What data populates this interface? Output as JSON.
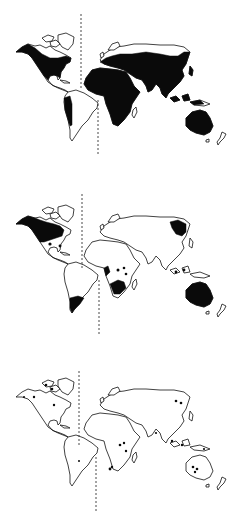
{
  "figure": {
    "colors": {
      "fill": "#0a0a0a",
      "outline": "#111111",
      "background": "#ffffff",
      "divider": "#333333"
    },
    "maps": [
      {
        "index": 1,
        "label": "",
        "shaded_regions": [
          "North America (south of arctic)",
          "Central America",
          "western South America",
          "Africa",
          "Eurasia (south of arctic)",
          "South/Southeast Asia",
          "Indonesia",
          "Australia"
        ]
      },
      {
        "index": 2,
        "label": "",
        "shaded_regions": [
          "Canada / northern North America",
          "southern South America",
          "southern Africa",
          "scattered central/east Africa patches",
          "far-east Siberia",
          "Southeast Asia islands",
          "Australia"
        ]
      },
      {
        "index": 3,
        "label": "",
        "shaded_regions": [
          "scattered dots: arctic Canada",
          "scattered dots: East Africa",
          "scattered dots: Southeast Asia",
          "scattered dots: Australia",
          "scattered dots: far-east Russia"
        ]
      }
    ]
  }
}
